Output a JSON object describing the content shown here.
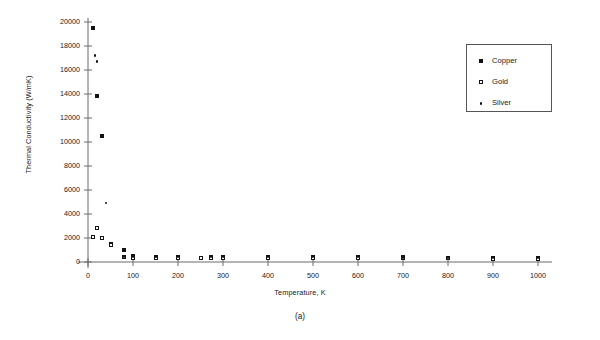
{
  "chart_data": {
    "type": "scatter",
    "title": "",
    "subtitle": "",
    "caption": "(a)",
    "xlabel": "Temperature, K",
    "ylabel": "Thermal Conductivity (W/mK)",
    "xlim": [
      0,
      1000
    ],
    "ylim": [
      0,
      20000
    ],
    "xticks": [
      0,
      100,
      200,
      300,
      400,
      500,
      600,
      700,
      800,
      900,
      1000
    ],
    "yticks": [
      0,
      2000,
      4000,
      6000,
      8000,
      10000,
      12000,
      14000,
      16000,
      18000,
      20000
    ],
    "grid": false,
    "legend_position": "upper right",
    "series": [
      {
        "name": "Copper",
        "marker": "filled-square",
        "color": "#141414",
        "points": [
          {
            "x": 10,
            "y": 19500
          },
          {
            "x": 20,
            "y": 13800
          },
          {
            "x": 30,
            "y": 10500
          },
          {
            "x": 50,
            "y": 1500
          },
          {
            "x": 80,
            "y": 1000
          },
          {
            "x": 100,
            "y": 480
          },
          {
            "x": 150,
            "y": 428
          },
          {
            "x": 200,
            "y": 413
          },
          {
            "x": 273,
            "y": 401
          },
          {
            "x": 300,
            "y": 398
          },
          {
            "x": 400,
            "y": 392
          },
          {
            "x": 500,
            "y": 388
          },
          {
            "x": 600,
            "y": 383
          },
          {
            "x": 700,
            "y": 377
          },
          {
            "x": 800,
            "y": 371
          },
          {
            "x": 900,
            "y": 364
          },
          {
            "x": 1000,
            "y": 357
          }
        ]
      },
      {
        "name": "Gold",
        "marker": "open-square",
        "color": "#141414",
        "points": [
          {
            "x": 10,
            "y": 2100
          },
          {
            "x": 20,
            "y": 2800
          },
          {
            "x": 30,
            "y": 2000
          },
          {
            "x": 50,
            "y": 1400
          },
          {
            "x": 80,
            "y": 420
          },
          {
            "x": 100,
            "y": 327
          },
          {
            "x": 150,
            "y": 323
          },
          {
            "x": 200,
            "y": 320
          },
          {
            "x": 250,
            "y": 318
          },
          {
            "x": 273,
            "y": 317
          },
          {
            "x": 300,
            "y": 315
          },
          {
            "x": 400,
            "y": 312
          },
          {
            "x": 500,
            "y": 309
          },
          {
            "x": 600,
            "y": 304
          },
          {
            "x": 700,
            "y": 298
          },
          {
            "x": 800,
            "y": 292
          },
          {
            "x": 900,
            "y": 285
          },
          {
            "x": 1000,
            "y": 278
          }
        ]
      },
      {
        "name": "Silver",
        "marker": "dot",
        "color": "#141414",
        "points": [
          {
            "x": 16,
            "y": 17200
          },
          {
            "x": 20,
            "y": 16700
          },
          {
            "x": 40,
            "y": 4900
          },
          {
            "x": 80,
            "y": 450
          },
          {
            "x": 100,
            "y": 432
          },
          {
            "x": 150,
            "y": 432
          },
          {
            "x": 200,
            "y": 430
          },
          {
            "x": 273,
            "y": 428
          },
          {
            "x": 300,
            "y": 427
          },
          {
            "x": 400,
            "y": 420
          },
          {
            "x": 500,
            "y": 413
          },
          {
            "x": 600,
            "y": 405
          },
          {
            "x": 700,
            "y": 397
          },
          {
            "x": 800,
            "y": 389
          },
          {
            "x": 900,
            "y": 382
          },
          {
            "x": 1000,
            "y": 374
          }
        ]
      }
    ]
  },
  "legend": {
    "items": [
      {
        "label": "Copper",
        "symbol": "filled-square-icon"
      },
      {
        "label": "Gold",
        "symbol": "open-square-icon"
      },
      {
        "label": "Silver",
        "symbol": "dot-icon"
      }
    ]
  },
  "colors": {
    "ink": "#141414",
    "axis": "#6b6b6b",
    "background": "#ffffff"
  }
}
